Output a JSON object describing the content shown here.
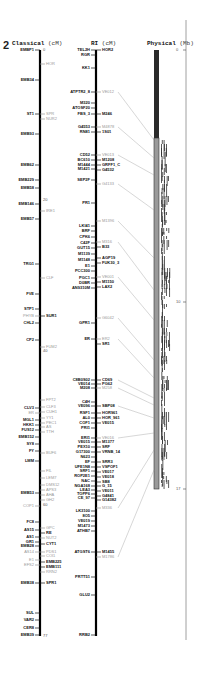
{
  "figure": {
    "chromosome_number": "2",
    "columns": {
      "classical": {
        "title": "Classical",
        "unit": "(cM)"
      },
      "ri": {
        "title": "RI",
        "unit": "(cM)"
      },
      "physical": {
        "title": "Physical",
        "unit": "(Mb)"
      }
    },
    "classical_scale": [
      {
        "label": "0",
        "y": 50
      },
      {
        "label": "20",
        "y": 200
      },
      {
        "label": "40",
        "y": 351
      },
      {
        "label": "60",
        "y": 505
      },
      {
        "label": "77",
        "y": 636
      }
    ],
    "physical_scale": [
      {
        "label": "0",
        "y": 50
      },
      {
        "label": "10",
        "y": 302
      },
      {
        "label": "17",
        "y": 489
      }
    ],
    "classical_left_markers": [
      {
        "label": "EMBP1",
        "y": 50
      },
      {
        "label": "EMB34",
        "y": 80
      },
      {
        "label": "ST1",
        "y": 114
      },
      {
        "label": "EMB93",
        "y": 134
      },
      {
        "label": "EMB62",
        "y": 165
      },
      {
        "label": "EMB229",
        "y": 180
      },
      {
        "label": "EMB58",
        "y": 188
      },
      {
        "label": "EMB146",
        "y": 204
      },
      {
        "label": "EMB57",
        "y": 219
      },
      {
        "label": "TRG1",
        "y": 264
      },
      {
        "label": "FVE",
        "y": 294
      },
      {
        "label": "STP1",
        "y": 309
      },
      {
        "label": "PHYB",
        "y": 316,
        "grey": true
      },
      {
        "label": "CHL2",
        "y": 323
      },
      {
        "label": "CP2",
        "y": 340
      },
      {
        "label": "CLV3",
        "y": 408
      },
      {
        "label": "ER",
        "y": 413,
        "grey": true
      },
      {
        "label": "MGL1",
        "y": 420
      },
      {
        "label": "HKK1",
        "y": 425
      },
      {
        "label": "FUS12",
        "y": 430
      },
      {
        "label": "EMB152",
        "y": 437
      },
      {
        "label": "SY8",
        "y": 444
      },
      {
        "label": "FY",
        "y": 451
      },
      {
        "label": "LMM",
        "y": 461
      },
      {
        "label": "EMB53",
        "y": 493
      },
      {
        "label": "COP1",
        "y": 506,
        "grey": true
      },
      {
        "label": "FC8",
        "y": 522
      },
      {
        "label": "AS15",
        "y": 530
      },
      {
        "label": "AS1",
        "y": 537
      },
      {
        "label": "GR1",
        "y": 542
      },
      {
        "label": "EMB28",
        "y": 546
      },
      {
        "label": "AS14",
        "y": 552,
        "grey": true
      },
      {
        "label": "E1",
        "y": 560,
        "grey": true
      },
      {
        "label": "EFS2",
        "y": 565,
        "grey": true
      },
      {
        "label": "EMB38",
        "y": 583
      },
      {
        "label": "SUL",
        "y": 613
      },
      {
        "label": "VAR2",
        "y": 620
      },
      {
        "label": "CER8",
        "y": 628
      },
      {
        "label": "EMB39",
        "y": 635
      }
    ],
    "classical_right_markers": [
      {
        "label": "HOR",
        "y": 64,
        "grey": true
      },
      {
        "label": "SPR",
        "y": 114,
        "grey": true
      },
      {
        "label": "NUR2",
        "y": 119,
        "grey": true
      },
      {
        "label": "IRE1",
        "y": 211,
        "grey": true
      },
      {
        "label": "CLF",
        "y": 278,
        "grey": true
      },
      {
        "label": "SUR1",
        "y": 316
      },
      {
        "label": "FUM2",
        "y": 347,
        "grey": true
      },
      {
        "label": "FPT2",
        "y": 400,
        "grey": true
      },
      {
        "label": "CLF3",
        "y": 407,
        "grey": true
      },
      {
        "label": "CUH1",
        "y": 412,
        "grey": true
      },
      {
        "label": "YY1",
        "y": 418,
        "grey": true
      },
      {
        "label": "PEC1",
        "y": 423,
        "grey": true
      },
      {
        "label": "AS",
        "y": 427,
        "grey": true
      },
      {
        "label": "TTH",
        "y": 432,
        "grey": true
      },
      {
        "label": "BUF6",
        "y": 453,
        "grey": true
      },
      {
        "label": "FIL",
        "y": 471,
        "grey": true
      },
      {
        "label": "LEM7",
        "y": 478,
        "grey": true
      },
      {
        "label": "DMS12",
        "y": 485,
        "grey": true
      },
      {
        "label": "APS3",
        "y": 490,
        "grey": true
      },
      {
        "label": "AHA",
        "y": 495,
        "grey": true
      },
      {
        "label": "GH2",
        "y": 500,
        "grey": true
      },
      {
        "label": "GPC",
        "y": 528,
        "grey": true
      },
      {
        "label": "RE",
        "y": 533
      },
      {
        "label": "NUT2",
        "y": 538,
        "grey": true
      },
      {
        "label": "CYT1",
        "y": 544
      },
      {
        "label": "PDS1",
        "y": 552,
        "grey": true
      },
      {
        "label": "COI1",
        "y": 556,
        "grey": true
      },
      {
        "label": "EMB225",
        "y": 562
      },
      {
        "label": "EMB111",
        "y": 567
      },
      {
        "label": "RRN2",
        "y": 572,
        "grey": true
      },
      {
        "label": "SPR1",
        "y": 583
      }
    ],
    "ri_left_markers": [
      {
        "label": "TEL2H",
        "y": 50
      },
      {
        "label": "RGR",
        "y": 55
      },
      {
        "label": "KK1",
        "y": 68
      },
      {
        "label": "ATPTR2_8",
        "y": 92
      },
      {
        "label": "M320",
        "y": 103
      },
      {
        "label": "ATOSF20",
        "y": 108
      },
      {
        "label": "FBS_3",
        "y": 114
      },
      {
        "label": "G4553",
        "y": 127
      },
      {
        "label": "RN81",
        "y": 132
      },
      {
        "label": "CD52",
        "y": 155
      },
      {
        "label": "BC610",
        "y": 160
      },
      {
        "label": "M1444",
        "y": 165
      },
      {
        "label": "M1421",
        "y": 169
      },
      {
        "label": "SEP2F",
        "y": 180
      },
      {
        "label": "PR1",
        "y": 203
      },
      {
        "label": "LKI41",
        "y": 226
      },
      {
        "label": "BRF",
        "y": 231
      },
      {
        "label": "CPK6",
        "y": 237
      },
      {
        "label": "C42F",
        "y": 243
      },
      {
        "label": "GUT15",
        "y": 248
      },
      {
        "label": "M1139",
        "y": 254
      },
      {
        "label": "M1148",
        "y": 260
      },
      {
        "label": "E1",
        "y": 266
      },
      {
        "label": "PCC300",
        "y": 271
      },
      {
        "label": "PGC1",
        "y": 278
      },
      {
        "label": "D0BR",
        "y": 283
      },
      {
        "label": "AN9310M",
        "y": 288
      },
      {
        "label": "GPR1",
        "y": 323
      },
      {
        "label": "ER",
        "y": 339
      },
      {
        "label": "C8B0S02",
        "y": 380
      },
      {
        "label": "VE014",
        "y": 384
      },
      {
        "label": "M208",
        "y": 388
      },
      {
        "label": "C4H",
        "y": 402
      },
      {
        "label": "VE096",
        "y": 406
      },
      {
        "label": "RSF1",
        "y": 413
      },
      {
        "label": "AL0",
        "y": 418
      },
      {
        "label": "COF1",
        "y": 423
      },
      {
        "label": "PRI1",
        "y": 428
      },
      {
        "label": "ERI1",
        "y": 438
      },
      {
        "label": "VE015",
        "y": 442
      },
      {
        "label": "PEX10",
        "y": 447
      },
      {
        "label": "G17300",
        "y": 452
      },
      {
        "label": "N623",
        "y": 457
      },
      {
        "label": "EF",
        "y": 462
      },
      {
        "label": "UFE1N8",
        "y": 467
      },
      {
        "label": "SRF1",
        "y": 471
      },
      {
        "label": "ROP2E1",
        "y": 476
      },
      {
        "label": "NAC",
        "y": 481
      },
      {
        "label": "NGA168",
        "y": 486
      },
      {
        "label": "LEA3",
        "y": 490
      },
      {
        "label": "TOPP6",
        "y": 494
      },
      {
        "label": "CE_97",
        "y": 498
      },
      {
        "label": "LK3100",
        "y": 511
      },
      {
        "label": "8O5",
        "y": 516
      },
      {
        "label": "VE019",
        "y": 521
      },
      {
        "label": "M1473",
        "y": 526
      },
      {
        "label": "ATHB7",
        "y": 531
      },
      {
        "label": "ATGST6",
        "y": 552
      },
      {
        "label": "PRTT51",
        "y": 577
      },
      {
        "label": "GLU2",
        "y": 595
      },
      {
        "label": "RRB2",
        "y": 635
      }
    ],
    "ri_right_markers": [
      {
        "label": "HOR2",
        "y": 50
      },
      {
        "label": "VE012",
        "y": 92,
        "grey": true
      },
      {
        "label": "M246",
        "y": 114
      },
      {
        "label": "M4878",
        "y": 127,
        "grey": true
      },
      {
        "label": "1S01",
        "y": 132
      },
      {
        "label": "VE013",
        "y": 155,
        "grey": true
      },
      {
        "label": "M1208",
        "y": 160
      },
      {
        "label": "GRFF1_C",
        "y": 165
      },
      {
        "label": "G4532",
        "y": 170
      },
      {
        "label": "G4133",
        "y": 184,
        "grey": true
      },
      {
        "label": "M1396",
        "y": 221,
        "grey": true
      },
      {
        "label": "M316",
        "y": 242,
        "grey": true
      },
      {
        "label": "B33",
        "y": 247
      },
      {
        "label": "AGP19",
        "y": 258
      },
      {
        "label": "FUK30_3",
        "y": 263
      },
      {
        "label": "VE001",
        "y": 277,
        "grey": true
      },
      {
        "label": "M1150",
        "y": 282
      },
      {
        "label": "LAX2",
        "y": 287
      },
      {
        "label": "G6042",
        "y": 318,
        "grey": true
      },
      {
        "label": "ER2",
        "y": 339,
        "grey": true
      },
      {
        "label": "SR1",
        "y": 344
      },
      {
        "label": "CD69",
        "y": 380
      },
      {
        "label": "PG62",
        "y": 384
      },
      {
        "label": "M258",
        "y": 388,
        "grey": true
      },
      {
        "label": "SBP08",
        "y": 406
      },
      {
        "label": "HOR961",
        "y": 413
      },
      {
        "label": "HOR_961",
        "y": 418
      },
      {
        "label": "VE015",
        "y": 423
      },
      {
        "label": "VE016",
        "y": 438,
        "grey": true
      },
      {
        "label": "M1377",
        "y": 442
      },
      {
        "label": "SRF",
        "y": 447
      },
      {
        "label": "VRNB_14",
        "y": 452
      },
      {
        "label": "SRR3",
        "y": 462
      },
      {
        "label": "VSPOF1",
        "y": 467
      },
      {
        "label": "VE017",
        "y": 472
      },
      {
        "label": "VE018",
        "y": 477
      },
      {
        "label": "SB8",
        "y": 482
      },
      {
        "label": "G_15",
        "y": 486
      },
      {
        "label": "VE011",
        "y": 491
      },
      {
        "label": "G4841",
        "y": 496
      },
      {
        "label": "G14382",
        "y": 500
      },
      {
        "label": "M336",
        "y": 508,
        "grey": true
      },
      {
        "label": "M1455",
        "y": 552
      },
      {
        "label": "M1786",
        "y": 557,
        "grey": true
      }
    ],
    "physical_bar": {
      "top": 50,
      "bottom": 489,
      "dark_end": 138,
      "dark_color": "#2a2a2a",
      "light_color": "#9a9a9a"
    }
  }
}
